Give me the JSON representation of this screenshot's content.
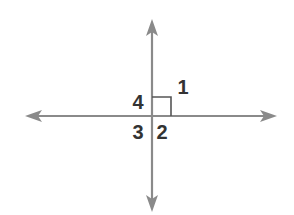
{
  "diagram": {
    "type": "perpendicular-lines",
    "colors": {
      "line": "#8a8a8a",
      "right_angle_marker": "#555555",
      "label": "#333333",
      "background": "#ffffff"
    },
    "intersection": {
      "x": 152,
      "y": 116
    },
    "horizontal_line": {
      "x1": 25,
      "x2": 277,
      "y": 116,
      "arrows": [
        "left",
        "right"
      ]
    },
    "vertical_line": {
      "x": 152,
      "y1": 19,
      "y2": 212,
      "arrows": [
        "up",
        "down"
      ]
    },
    "right_angle_marker": {
      "angle": "1",
      "size": 19
    },
    "angles": [
      {
        "label": "1",
        "x": 183,
        "y": 94
      },
      {
        "label": "2",
        "x": 162,
        "y": 139
      },
      {
        "label": "3",
        "x": 138,
        "y": 139
      },
      {
        "label": "4",
        "x": 138,
        "y": 109
      }
    ]
  }
}
